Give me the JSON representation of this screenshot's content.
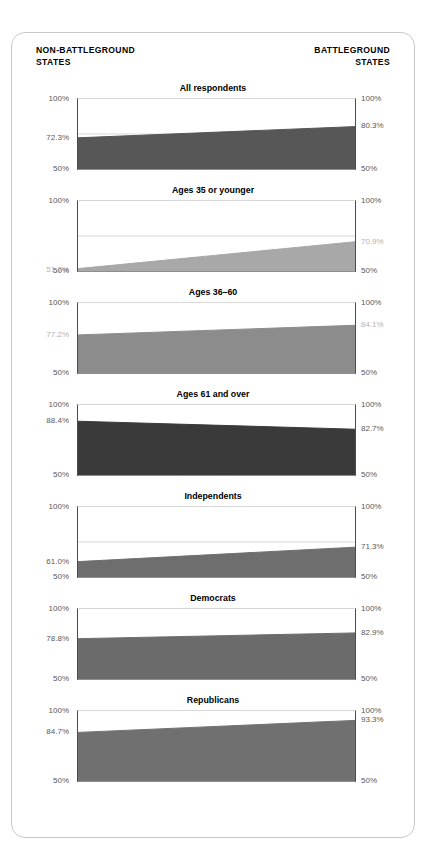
{
  "header": {
    "left_label": "NON-BATTLEGROUND\nSTATES",
    "right_label": "BATTLEGROUND\nSTATES"
  },
  "axis": {
    "top_label": "100%",
    "bottom_label": "50%"
  },
  "colors": {
    "fill_all": "#575757",
    "fill_young": "#a8a8a8",
    "fill_mid": "#8c8c8c",
    "fill_old": "#3a3a3a",
    "fill_independents": "#6e6e6e",
    "fill_democrats": "#6b6b6b",
    "fill_republicans": "#707070",
    "axis_line": "#4c4c4c",
    "gridline": "#d7d7d7",
    "tick_text": "#58585a",
    "tick_text_muted": "#b2b2b2",
    "card_border": "#c9c9c9"
  },
  "chart_data": {
    "type": "area",
    "title": "",
    "xlabel": "",
    "ylabel": "",
    "ylim": [
      50,
      100
    ],
    "grid": true,
    "x": [
      "NON-BATTLEGROUND STATES",
      "BATTLEGROUND STATES"
    ],
    "legend_position": "none",
    "panels": [
      {
        "title": "All respondents",
        "left_value": 72.3,
        "right_value": 80.3,
        "left_label": "72.3%",
        "right_label": "80.3%",
        "top_label": "100%",
        "bottom_label": "50%",
        "fill": "#575757",
        "left_label_muted": false,
        "right_label_muted": false
      },
      {
        "title": "Ages 35 or younger",
        "left_value": 51.7,
        "right_value": 70.9,
        "left_label": "51.7%",
        "right_label": "70.9%",
        "top_label": "100%",
        "bottom_label": "50%",
        "fill": "#a8a8a8",
        "left_label_muted": true,
        "right_label_muted": true
      },
      {
        "title": "Ages 36–60",
        "left_value": 77.2,
        "right_value": 84.1,
        "left_label": "77.2%",
        "right_label": "84.1%",
        "top_label": "100%",
        "bottom_label": "50%",
        "fill": "#8c8c8c",
        "left_label_muted": true,
        "right_label_muted": true
      },
      {
        "title": "Ages 61 and over",
        "left_value": 88.4,
        "right_value": 82.7,
        "left_label": "88.4%",
        "right_label": "82.7%",
        "top_label": "100%",
        "bottom_label": "50%",
        "fill": "#3a3a3a",
        "left_label_muted": false,
        "right_label_muted": false
      },
      {
        "title": "Independents",
        "left_value": 61.0,
        "right_value": 71.3,
        "left_label": "61.0%",
        "right_label": "71.3%",
        "top_label": "100%",
        "bottom_label": "50%",
        "fill": "#6e6e6e",
        "left_label_muted": false,
        "right_label_muted": false
      },
      {
        "title": "Democrats",
        "left_value": 78.8,
        "right_value": 82.9,
        "left_label": "78.8%",
        "right_label": "82.9%",
        "top_label": "100%",
        "bottom_label": "50%",
        "fill": "#6b6b6b",
        "left_label_muted": false,
        "right_label_muted": false
      },
      {
        "title": "Republicans",
        "left_value": 84.7,
        "right_value": 93.3,
        "left_label": "84.7%",
        "right_label": "93.3%",
        "top_label": "100%",
        "bottom_label": "50%",
        "fill": "#707070",
        "left_label_muted": false,
        "right_label_muted": false
      }
    ]
  }
}
